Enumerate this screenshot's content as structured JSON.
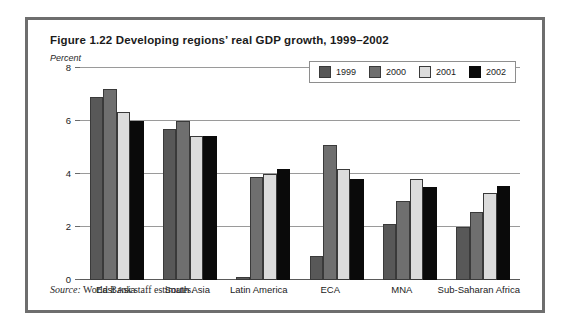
{
  "figure": {
    "title": "Figure 1.22  Developing regions’ real GDP growth, 1999–2002",
    "unit_label": "Percent",
    "source_word": "Source:",
    "source_text": " World Bank staff estimates."
  },
  "legend": {
    "position": "top-right-inside",
    "items": [
      {
        "label": "1999",
        "color": "#585858"
      },
      {
        "label": "2000",
        "color": "#6f6f6f"
      },
      {
        "label": "2001",
        "color": "#dcdcdc"
      },
      {
        "label": "2002",
        "color": "#0a0a0a"
      }
    ]
  },
  "chart_data": {
    "type": "bar",
    "title": "Figure 1.22  Developing regions’ real GDP growth, 1999–2002",
    "xlabel": "",
    "ylabel": "Percent",
    "ylim": [
      0,
      8
    ],
    "yticks": [
      0,
      2,
      4,
      6,
      8
    ],
    "ytick_labels": [
      "0",
      "2",
      "4",
      "6",
      "8"
    ],
    "grid": true,
    "legend_position": "upper right",
    "categories": [
      "East Asia",
      "South Asia",
      "Latin America",
      "ECA",
      "MNA",
      "Sub-Saharan Africa"
    ],
    "series": [
      {
        "name": "1999",
        "color": "#585858",
        "values": [
          6.9,
          5.7,
          0.1,
          0.9,
          2.1,
          2.0
        ]
      },
      {
        "name": "2000",
        "color": "#6f6f6f",
        "values": [
          7.2,
          6.0,
          3.9,
          5.1,
          3.0,
          2.55
        ]
      },
      {
        "name": "2001",
        "color": "#dcdcdc",
        "values": [
          6.35,
          5.45,
          4.0,
          4.2,
          3.8,
          3.3
        ]
      },
      {
        "name": "2002",
        "color": "#0a0a0a",
        "values": [
          6.0,
          5.45,
          4.2,
          3.8,
          3.5,
          3.55
        ]
      }
    ],
    "source": "Source: World Bank staff estimates."
  }
}
